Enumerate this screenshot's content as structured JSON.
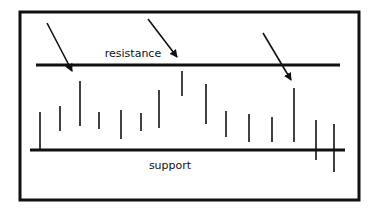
{
  "diagram": {
    "title": "",
    "frame": {
      "x": 20,
      "y": 12,
      "width": 339,
      "height": 188,
      "stroke": "#111111",
      "stroke_width": 3
    },
    "resistance": {
      "label": "resistance",
      "y": 65,
      "x1": 36,
      "x2": 340,
      "label_x": 133,
      "label_y": 57
    },
    "support": {
      "label": "support",
      "y": 150,
      "x1": 30,
      "x2": 345,
      "label_x": 170,
      "label_y": 169
    },
    "bars": [
      {
        "x": 40,
        "y1": 112,
        "y2": 149
      },
      {
        "x": 60,
        "y1": 106,
        "y2": 131
      },
      {
        "x": 80,
        "y1": 81,
        "y2": 126
      },
      {
        "x": 99,
        "y1": 112,
        "y2": 129
      },
      {
        "x": 121,
        "y1": 110,
        "y2": 139
      },
      {
        "x": 141,
        "y1": 113,
        "y2": 131
      },
      {
        "x": 159,
        "y1": 90,
        "y2": 128
      },
      {
        "x": 182,
        "y1": 71,
        "y2": 96
      },
      {
        "x": 206,
        "y1": 84,
        "y2": 124
      },
      {
        "x": 226,
        "y1": 111,
        "y2": 137
      },
      {
        "x": 249,
        "y1": 114,
        "y2": 142
      },
      {
        "x": 272,
        "y1": 117,
        "y2": 142
      },
      {
        "x": 294,
        "y1": 88,
        "y2": 142
      },
      {
        "x": 316,
        "y1": 120,
        "y2": 160
      },
      {
        "x": 334,
        "y1": 124,
        "y2": 172
      }
    ],
    "arrows": [
      {
        "x1": 47,
        "y1": 23,
        "x2": 72,
        "y2": 71
      },
      {
        "x1": 148,
        "y1": 19,
        "x2": 177,
        "y2": 57
      },
      {
        "x1": 263,
        "y1": 33,
        "x2": 291,
        "y2": 80
      }
    ],
    "colors": {
      "line": "#111111",
      "background": "#ffffff"
    }
  }
}
